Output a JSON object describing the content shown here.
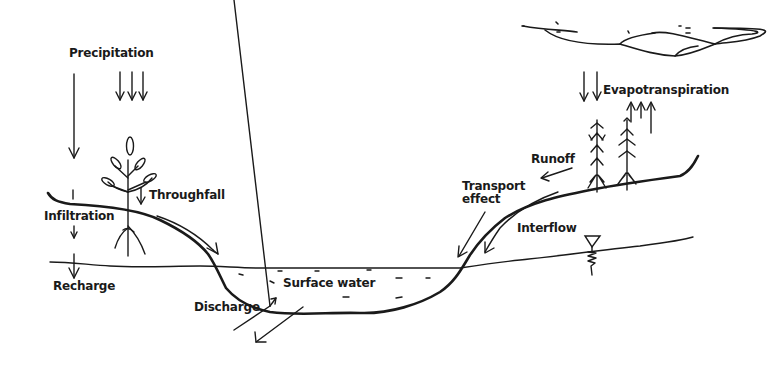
{
  "diagram": {
    "labels": {
      "precipitation": "Precipitation",
      "evapotranspiration": "Evapotranspiration",
      "throughfall": "Throughfall",
      "infiltration": "Infiltration",
      "recharge": "Recharge",
      "runoff": "Runoff",
      "transport_line1": "Transport",
      "transport_line2": "effect",
      "interflow": "Interflow",
      "surface_water": "Surface water",
      "discharge": "Discharge"
    },
    "colors": {
      "ink": "#1a1a1a",
      "background": "#ffffff"
    }
  }
}
